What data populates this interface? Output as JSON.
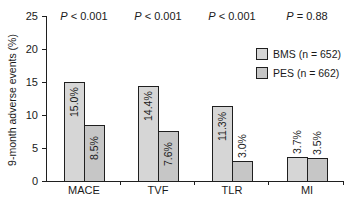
{
  "chart_data": {
    "type": "bar",
    "title": "",
    "xlabel": "",
    "ylabel": "9-month adverse events (%)",
    "ylim": [
      0,
      25
    ],
    "yticks": [
      0,
      5,
      10,
      15,
      20,
      25
    ],
    "categories": [
      "MACE",
      "TVF",
      "TLR",
      "MI"
    ],
    "series": [
      {
        "name": "BMS (n = 652)",
        "values": [
          15.0,
          14.4,
          11.3,
          3.7
        ],
        "labels": [
          "15.0%",
          "14.4%",
          "11.3%",
          "3.7%"
        ],
        "color": "#d6d6d6"
      },
      {
        "name": "PES (n = 662)",
        "values": [
          8.5,
          7.6,
          3.0,
          3.5
        ],
        "labels": [
          "8.5%",
          "7.6%",
          "3.0%",
          "3.5%"
        ],
        "color": "#c6c6c6"
      }
    ],
    "annotations": [
      {
        "category": "MACE",
        "text": "P < 0.001"
      },
      {
        "category": "TVF",
        "text": "P < 0.001"
      },
      {
        "category": "TLR",
        "text": "P < 0.001"
      },
      {
        "category": "MI",
        "text": "P = 0.88"
      }
    ],
    "legend_position": "upper right",
    "grid": false
  },
  "labels": {
    "ylabel": "9-month adverse events (%)",
    "yticks": [
      "0",
      "5",
      "10",
      "15",
      "20",
      "25"
    ],
    "categories": [
      "MACE",
      "TVF",
      "TLR",
      "MI"
    ],
    "pvalues": [
      {
        "sym": "P",
        "rest": " < 0.001"
      },
      {
        "sym": "P",
        "rest": " < 0.001"
      },
      {
        "sym": "P",
        "rest": " < 0.001"
      },
      {
        "sym": "P",
        "rest": " = 0.88"
      }
    ],
    "legend": [
      "BMS (n = 652)",
      "PES (n = 662)"
    ]
  }
}
